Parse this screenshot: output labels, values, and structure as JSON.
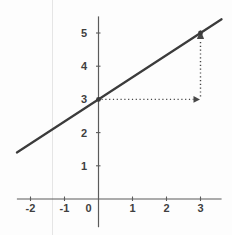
{
  "chart_data": {
    "type": "line",
    "title": "",
    "xlabel": "",
    "ylabel": "",
    "grid": false,
    "legend": false,
    "x_ticks": [
      "-2",
      "-1",
      "0",
      "1",
      "2",
      "3"
    ],
    "y_ticks": [
      "1",
      "2",
      "3",
      "4",
      "5"
    ],
    "xlim": [
      -2.4,
      3.62
    ],
    "ylim": [
      -0.85,
      5.5
    ],
    "series": [
      {
        "name": "line-y-equals-two-thirds-x-plus-3",
        "slope": 0.6667,
        "intercept": 3,
        "x_range": [
          -2.4,
          3.62
        ],
        "sample_points": [
          [
            -2.4,
            1.4
          ],
          [
            0,
            3
          ],
          [
            3,
            5
          ],
          [
            3.62,
            5.41
          ]
        ]
      }
    ],
    "key_points": [
      {
        "x": 0,
        "y": 3,
        "label": "y-intercept"
      },
      {
        "x": 3,
        "y": 5,
        "label": "point-on-line"
      }
    ],
    "annotations": [
      {
        "type": "dotted-arrow",
        "from": [
          0,
          3
        ],
        "to": [
          3,
          3
        ],
        "direction": "right"
      },
      {
        "type": "dotted-arrow",
        "from": [
          3,
          3
        ],
        "to": [
          3,
          5
        ],
        "direction": "up"
      }
    ],
    "colors": {
      "axis": "#5b5b5b",
      "line": "#3b3b3b",
      "dotted": "#474747",
      "tick_label": "#3f3f3f",
      "background": "#fdfdfd"
    }
  }
}
